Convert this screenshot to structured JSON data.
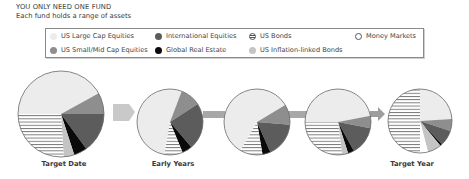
{
  "header": {
    "title": "YOU ONLY NEED ONE FUND",
    "subtitle": "Each fund holds a range of assets"
  },
  "colors": {
    "us_large_cap": "#ececec",
    "international": "#5c5c5c",
    "us_bonds": "hatched",
    "money_markets": "#ffffff",
    "us_small_mid": "#8e8e8e",
    "global_real_estate": "#0a0a0a",
    "us_inflation_linked": "#c4c4c4",
    "arrow": "#c6c6c6",
    "arrow_dark": "#9a9a9a"
  },
  "legend": [
    {
      "key": "us_large_cap",
      "label": "US Large Cap Equities",
      "color": "#ececec",
      "pattern": "solid"
    },
    {
      "key": "international",
      "label": "International Equities",
      "color": "#5c5c5c",
      "pattern": "solid"
    },
    {
      "key": "us_bonds",
      "label": "US Bonds",
      "color": "#ffffff",
      "pattern": "hatched"
    },
    {
      "key": "money_markets",
      "label": "Money Markets",
      "color": "#ffffff",
      "pattern": "outline"
    },
    {
      "key": "us_small_mid",
      "label": "US Small/Mid Cap Equities",
      "color": "#8e8e8e",
      "pattern": "solid"
    },
    {
      "key": "global_real_estate",
      "label": "Global Real Estate",
      "color": "#0a0a0a",
      "pattern": "solid"
    },
    {
      "key": "us_inflation_linked",
      "label": "US Inflation-linked Bonds",
      "color": "#c4c4c4",
      "pattern": "solid"
    }
  ],
  "labels": {
    "target_date": "Target Date",
    "early_years": "Early Years",
    "target_year": "Target Year"
  },
  "chart_data": {
    "type": "pie",
    "title": "YOU ONLY NEED ONE FUND",
    "subtitle": "Each fund holds a range of assets",
    "legend_position": "top",
    "categories": [
      "US Large Cap Equities",
      "US Small/Mid Cap Equities",
      "International Equities",
      "Global Real Estate",
      "US Inflation-linked Bonds",
      "US Bonds",
      "Money Markets"
    ],
    "pies": [
      {
        "label": "Target Date",
        "cx": 61,
        "cy": 114,
        "r": 43,
        "start_angle": 270,
        "values": [
          42,
          8,
          15,
          5,
          4,
          26,
          0
        ]
      },
      {
        "label": "Early Years",
        "cx": 170,
        "cy": 122,
        "r": 33,
        "start_angle": 190,
        "values": [
          53,
          10,
          23,
          5,
          0,
          9,
          0
        ]
      },
      {
        "label": "",
        "cx": 257,
        "cy": 122,
        "r": 33,
        "start_angle": 210,
        "values": [
          58,
          10,
          17,
          4,
          0,
          11,
          0
        ]
      },
      {
        "label": "",
        "cx": 338,
        "cy": 122,
        "r": 33,
        "start_angle": 270,
        "values": [
          47,
          6,
          14,
          3,
          3,
          27,
          0
        ]
      },
      {
        "label": "Target Year",
        "cx": 420,
        "cy": 121,
        "r": 32,
        "start_angle": 0,
        "values": [
          24,
          6,
          8,
          1,
          7,
          50,
          4
        ]
      }
    ],
    "slice_order_note": "values listed clockwise from start_angle (degrees clockwise from 12 o'clock); percentages estimated from slice angles"
  }
}
